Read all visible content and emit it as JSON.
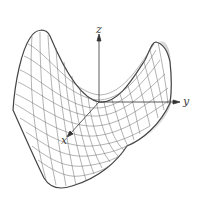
{
  "figure": {
    "type": "hyperbolic-paraboloid-saddle-surface",
    "axes": {
      "z_label": "z",
      "y_label": "y",
      "x_label": "x"
    },
    "colors": {
      "mesh": "#555555",
      "outline": "#444444",
      "axis": "#333333",
      "shade": "#bbbbbb"
    }
  }
}
